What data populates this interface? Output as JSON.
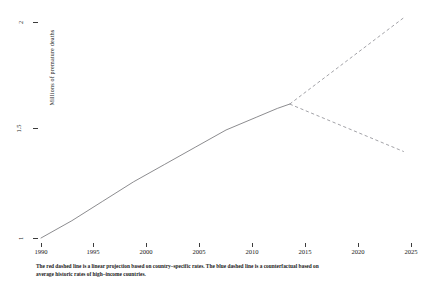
{
  "chart_data": {
    "type": "line",
    "title": "",
    "xlabel": "",
    "ylabel": "Millions of premature deaths",
    "xlim": [
      1990,
      2026
    ],
    "ylim": [
      0.96,
      2.06
    ],
    "grid": false,
    "legend_position": "none",
    "x_ticks": [
      1990,
      1995,
      2000,
      2005,
      2010,
      2015,
      2020,
      2025
    ],
    "x_tick_labels": [
      "1990",
      "1995",
      "2000",
      "2005",
      "2010",
      "2015",
      "2020",
      "2025"
    ],
    "y_ticks": [
      1,
      1.5,
      2
    ],
    "y_tick_labels": [
      "1",
      "1.5",
      "2"
    ],
    "series": [
      {
        "name": "Observed premature deaths",
        "style": "solid",
        "color": "#6e6e72",
        "x": [
          1990,
          1993,
          1996,
          1999,
          2002,
          2005,
          2008,
          2011,
          2013,
          2014.2
        ],
        "values": [
          1.0,
          1.08,
          1.17,
          1.26,
          1.34,
          1.42,
          1.5,
          1.56,
          1.6,
          1.62
        ]
      },
      {
        "name": "Linear projection based on country-specific rates",
        "style": "dashed",
        "color": "#8a8a90",
        "x": [
          2014.2,
          2025.3
        ],
        "values": [
          1.62,
          2.02
        ]
      },
      {
        "name": "Counterfactual based on average historic rates of high-income countries",
        "style": "dashed",
        "color": "#8a8a90",
        "x": [
          2014.2,
          2025.3
        ],
        "values": [
          1.62,
          1.4
        ]
      }
    ],
    "annotations": [
      {
        "name": "branch-point",
        "x": 2014.2,
        "y": 1.62
      }
    ]
  },
  "axes": {
    "y_title": "Millions of premature deaths",
    "y_tick_labels": [
      "2",
      "1.5",
      "1"
    ],
    "x_tick_labels": [
      "1990",
      "1995",
      "2000",
      "2005",
      "2010",
      "2015",
      "2020",
      "2025"
    ]
  },
  "caption": {
    "line1": "The red dashed line is a linear projection based on country–specific rates. The blue dashed line is a counterfactual based on",
    "line2": "average historic rates of high–income countries."
  }
}
